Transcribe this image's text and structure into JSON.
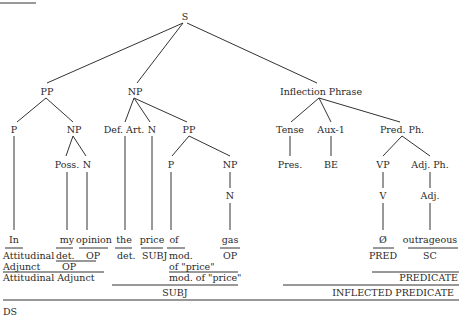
{
  "diagram": {
    "corner_label_cropped": "",
    "nodes": {
      "S": "S",
      "PP": "PP",
      "NP": "NP",
      "IP": "Inflection Phrase",
      "P1": "P",
      "NP2": "NP",
      "Poss": "Poss.",
      "N1": "N",
      "DefArt": "Def. Art.",
      "N2": "N",
      "PP2": "PP",
      "P2": "P",
      "NP3": "NP",
      "N3": "N",
      "Tense": "Tense",
      "Aux": "Aux-1",
      "PredPh": "Pred. Ph.",
      "Pres": "Pres.",
      "BE": "BE",
      "VP": "VP",
      "AdjPh": "Adj. Ph.",
      "V": "V",
      "Adj": "Adj."
    },
    "words": {
      "in": "In",
      "my": "my",
      "opinion": "opinion",
      "the": "the",
      "price": "price",
      "of": "of",
      "gas": "gas",
      "null": "Ø",
      "outrageous": "outrageous"
    },
    "functions": {
      "attitudinal": "Attitudinal",
      "adjunct": "Adjunct",
      "det1": "det.",
      "op1": "OP",
      "op_group": "OP",
      "det2": "det.",
      "subj1": "SUBJ",
      "mod": "mod.",
      "of_price": "of \"price\"",
      "op2": "OP",
      "mod_of_price": "mod. of \"price\"",
      "attitudinal_adjunct": "Attitudinal Adjunct",
      "subj": "SUBJ",
      "pred": "PRED",
      "sc": "SC",
      "predicate": "PREDICATE",
      "inflected_predicate": "INFLECTED PREDICATE",
      "ds": "DS"
    }
  }
}
